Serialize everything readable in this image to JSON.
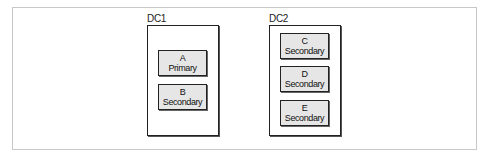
{
  "diagram": {
    "datacenters": [
      {
        "label": "DC1",
        "nodes": [
          {
            "name": "A",
            "role": "Primary"
          },
          {
            "name": "B",
            "role": "Secondary"
          }
        ]
      },
      {
        "label": "DC2",
        "nodes": [
          {
            "name": "C",
            "role": "Secondary"
          },
          {
            "name": "D",
            "role": "Secondary"
          },
          {
            "name": "E",
            "role": "Secondary"
          }
        ]
      }
    ],
    "colors": {
      "node_fill": "#e6e6e6",
      "border": "#222222",
      "frame": "#c8c8c8"
    }
  }
}
